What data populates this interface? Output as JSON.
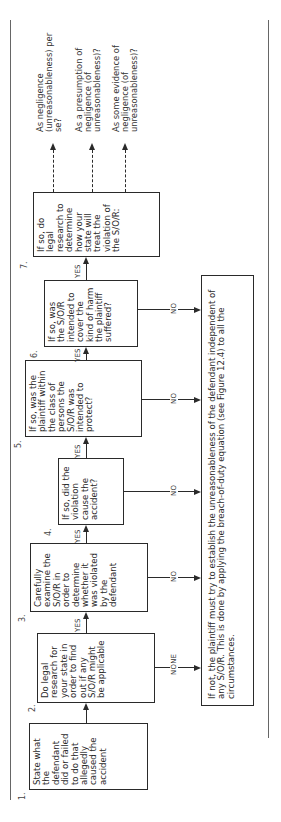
{
  "steps": [
    {
      "number": "1.",
      "text": "State what the defendant did or failed to do that allegedly caused the accident"
    },
    {
      "number": "2.",
      "text": "Do legal research for your state in order to find out if any S/O/R might be applicable"
    },
    {
      "number": "3.",
      "text": "Carefully examine the S/O/R in order to determine whether it was violated by the defendant"
    },
    {
      "number": "4.",
      "text": "If so, did the violation cause the accident?"
    },
    {
      "number": "5.",
      "text": "If so, was the plaintiff within the class of persons the S/O/R was intended to protect?"
    },
    {
      "number": "6.",
      "text": "If so, was the S/O/R intended to cover the kind of harm the plaintiff suffered?"
    },
    {
      "number": "7.",
      "text": "If so, do legal research to determine how your state will treat the violation of the S/O/R:"
    }
  ],
  "connector_labels": {
    "yes": "YES",
    "no": "NO",
    "none": "NONE"
  },
  "fallback": {
    "text": "If not, the plaintiff must try to establish the unreasonableness of the defendant independent of any S/O/R. This is done by applying the breach-of-duty equation (see Figure 12.4) to all the circumstances."
  },
  "outcomes": [
    {
      "text": "As negligence (unreasonableness) per se?"
    },
    {
      "text": "As a presumption of negligence (of unreasonableness)?"
    },
    {
      "text": "As some evidence of negligence (of unreasonableness)?"
    }
  ],
  "colors": {
    "ink": "#2a2a2a",
    "background": "#ffffff"
  }
}
